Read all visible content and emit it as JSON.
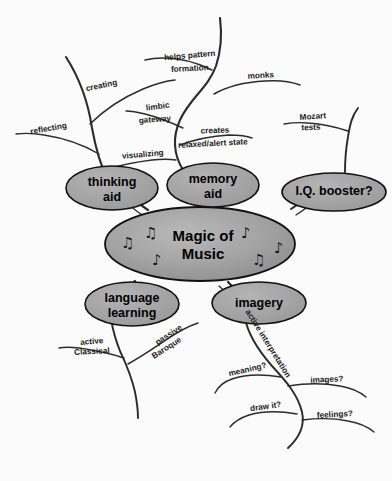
{
  "diagram": {
    "type": "mind-map",
    "title": "Magic of Music",
    "background_color": "#fbfbfb",
    "node_fill": "#a3a3a3",
    "node_stroke": "#111111",
    "branch_stroke": "#2b2b2b"
  },
  "center": {
    "label_line1": "Magic of",
    "label_line2": "Music",
    "decorations": [
      "music-note",
      "music-note",
      "music-note",
      "music-note",
      "music-note",
      "music-note"
    ],
    "note_glyphs": [
      "♫",
      "♫",
      "♪",
      "♪",
      "♫",
      "♪"
    ]
  },
  "nodes": [
    {
      "id": "thinking-aid",
      "label_line1": "thinking",
      "label_line2": "aid"
    },
    {
      "id": "memory-aid",
      "label_line1": "memory",
      "label_line2": "aid"
    },
    {
      "id": "iq-booster",
      "label_line1": "I.Q. booster?",
      "label_line2": ""
    },
    {
      "id": "language-learning",
      "label_line1": "language",
      "label_line2": "learning"
    },
    {
      "id": "imagery",
      "label_line1": "imagery",
      "label_line2": ""
    }
  ],
  "branches": {
    "thinking_aid": [
      {
        "id": "creating",
        "text": "creating"
      },
      {
        "id": "reflecting",
        "text": "reflecting"
      },
      {
        "id": "visualizing",
        "text": "visualizing"
      }
    ],
    "memory_aid": [
      {
        "id": "helps-pattern-formation",
        "line1": "helps pattern",
        "line2": "formation"
      },
      {
        "id": "monks",
        "line1": "monks",
        "line2": ""
      },
      {
        "id": "limbic-gateway",
        "line1": "limbic",
        "line2": "gateway"
      },
      {
        "id": "creates-relaxed-alert",
        "line1": "creates",
        "line2": "relaxed/alert state"
      }
    ],
    "iq_booster": [
      {
        "id": "mozart-tests",
        "line1": "Mozart",
        "line2": "tests"
      }
    ],
    "language_learning": [
      {
        "id": "active-classical",
        "line1": "active",
        "line2": "Classical"
      },
      {
        "id": "passive-baroque",
        "line1": "passive",
        "line2": "Baroque"
      }
    ],
    "imagery": [
      {
        "id": "active-interpretation",
        "text": "active interpretation"
      },
      {
        "id": "meaning",
        "text": "meaning?"
      },
      {
        "id": "images",
        "text": "images?"
      },
      {
        "id": "draw-it",
        "text": "draw it?"
      },
      {
        "id": "feelings",
        "text": "feelings?"
      }
    ]
  }
}
